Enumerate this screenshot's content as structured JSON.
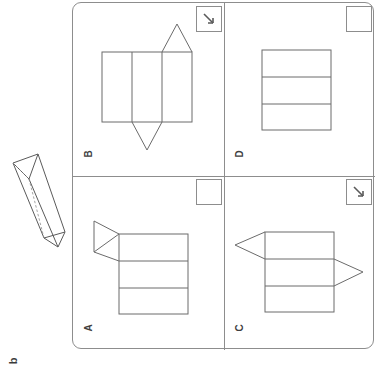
{
  "question": {
    "letter": "b",
    "prompt_figure": "triangular-prism"
  },
  "solid": {
    "name": "triangular-prism",
    "description": "Oblique triangular prism drawn in 3D with one hidden edge dashed",
    "stroke_color": "#5a5a5a"
  },
  "card": {
    "border_color": "#8d8d8d",
    "background": "#ffffff"
  },
  "panels": [
    {
      "id": "B",
      "label": "B",
      "position": "top-left",
      "selected": true,
      "marker": "check-arrow-icon",
      "net": {
        "type": "three-vertical-strips-with-two-triangles",
        "strips": 3,
        "strip_orientation": "vertical",
        "triangles": [
          {
            "on_strip": 3,
            "edge": "top",
            "points": "up"
          },
          {
            "on_strip": 2,
            "edge": "bottom",
            "points": "down"
          }
        ]
      }
    },
    {
      "id": "D",
      "label": "D",
      "position": "top-right",
      "selected": false,
      "marker": "empty-box",
      "net": {
        "type": "three-horizontal-strips-no-triangles",
        "strips": 3,
        "strip_orientation": "horizontal",
        "triangles": []
      }
    },
    {
      "id": "A",
      "label": "A",
      "position": "bottom-left",
      "selected": false,
      "marker": "empty-box",
      "net": {
        "type": "three-horizontal-strips-with-one-triangle",
        "strips": 3,
        "strip_orientation": "horizontal",
        "triangles": [
          {
            "on_strip": 1,
            "edge": "left",
            "points": "left"
          }
        ]
      }
    },
    {
      "id": "C",
      "label": "C",
      "position": "bottom-right",
      "selected": true,
      "marker": "check-arrow-icon",
      "net": {
        "type": "three-horizontal-strips-with-two-triangles",
        "strips": 3,
        "strip_orientation": "horizontal",
        "triangles": [
          {
            "on_strip": 1,
            "edge": "left",
            "points": "left"
          },
          {
            "on_strip": 2,
            "edge": "right",
            "points": "right"
          }
        ]
      }
    }
  ],
  "colors": {
    "ink": "#6b6b6b",
    "card_border": "#8d8d8d",
    "text": "#3a3a3a",
    "page": "#ffffff"
  }
}
